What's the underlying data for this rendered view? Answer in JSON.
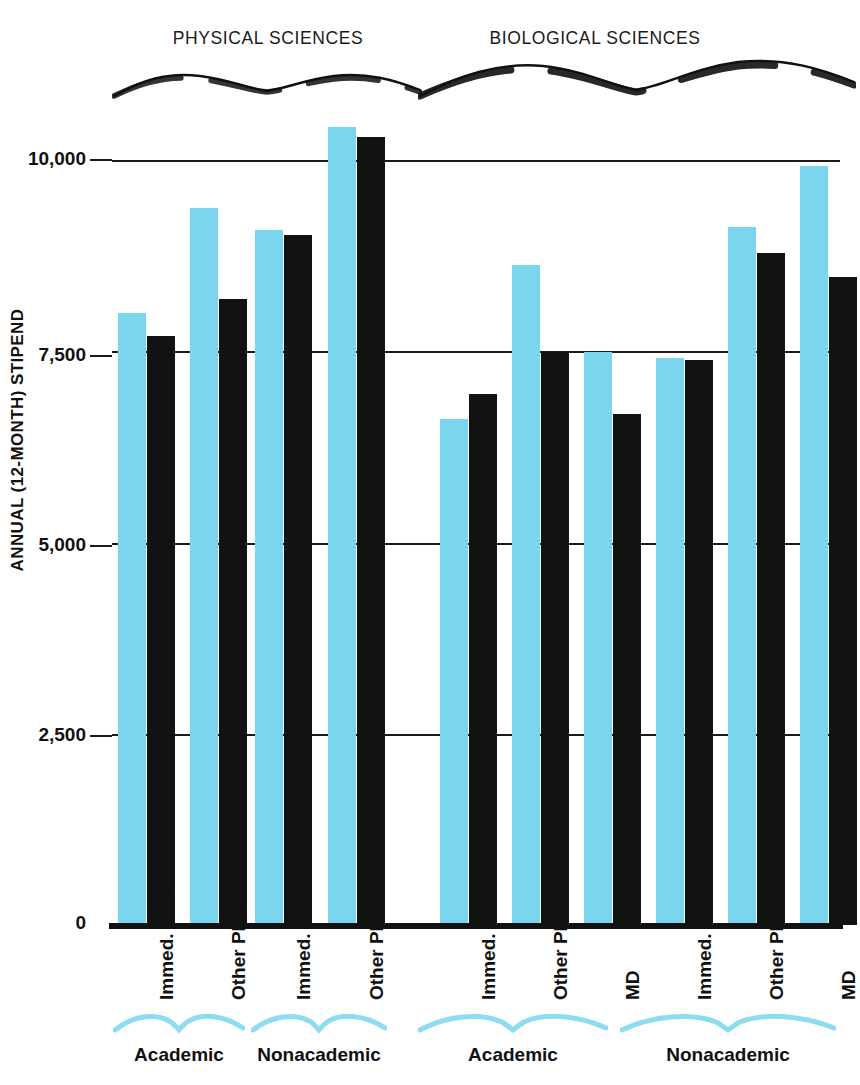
{
  "chart_data": {
    "type": "bar",
    "title": "",
    "xlabel": "",
    "ylabel": "ANNUAL (12-MONTH) STIPEND",
    "ylim": [
      0,
      10500
    ],
    "grid": true,
    "legend_position": "none",
    "ytick_labels": [
      "10,000",
      "7,500",
      "5,000",
      "2,500",
      "0"
    ],
    "ytick_values": [
      10000,
      7500,
      5000,
      2500,
      0
    ],
    "section_headers": [
      "PHYSICAL SCIENCES",
      "BIOLOGICAL SCIENCES"
    ],
    "sector_labels": [
      "Academic",
      "Nonacademic",
      "Academic",
      "Nonacademic"
    ],
    "categories": [
      "Immed. PhD",
      "Other PhD",
      "Immed. PhD",
      "Other PhD",
      "Immed. PhD",
      "Other PhD",
      "MD",
      "Immed. PhD",
      "Other PhD",
      "MD"
    ],
    "series": [
      {
        "name": "blue",
        "color": "#79d6ee",
        "values": [
          8000,
          9370,
          9080,
          10430,
          6620,
          8630,
          7490,
          7410,
          9130,
          9920
        ]
      },
      {
        "name": "black",
        "color": "#121212",
        "values": [
          7700,
          8180,
          9020,
          10300,
          6940,
          7490,
          6680,
          7390,
          8780,
          8470
        ]
      }
    ],
    "groups": [
      {
        "section": "PHYSICAL SCIENCES",
        "sector": "Academic",
        "bars": [
          {
            "category": "Immed. PhD",
            "blue": 8000,
            "black": 7700
          },
          {
            "category": "Other PhD",
            "blue": 9370,
            "black": 8180
          }
        ]
      },
      {
        "section": "PHYSICAL SCIENCES",
        "sector": "Nonacademic",
        "bars": [
          {
            "category": "Immed. PhD",
            "blue": 9080,
            "black": 9020
          },
          {
            "category": "Other PhD",
            "blue": 10430,
            "black": 10300
          }
        ]
      },
      {
        "section": "BIOLOGICAL SCIENCES",
        "sector": "Academic",
        "bars": [
          {
            "category": "Immed. PhD",
            "blue": 6620,
            "black": 6940
          },
          {
            "category": "Other PhD",
            "blue": 8630,
            "black": 7490
          },
          {
            "category": "MD",
            "blue": 7490,
            "black": 6680
          }
        ]
      },
      {
        "section": "BIOLOGICAL SCIENCES",
        "sector": "Nonacademic",
        "bars": [
          {
            "category": "Immed. PhD",
            "blue": 7410,
            "black": 7390
          },
          {
            "category": "Other PhD",
            "blue": 9130,
            "black": 8780
          },
          {
            "category": "MD",
            "blue": 9920,
            "black": 8470
          }
        ]
      }
    ]
  },
  "axis": {
    "y_title": "ANNUAL (12-MONTH) STIPEND",
    "ticks": [
      {
        "label": "10,000",
        "value": 10000
      },
      {
        "label": "7,500",
        "value": 7500
      },
      {
        "label": "5,000",
        "value": 5000
      },
      {
        "label": "2,500",
        "value": 2500
      },
      {
        "label": "0",
        "value": 0
      }
    ]
  },
  "headers": {
    "physical": "PHYSICAL SCIENCES",
    "biological": "BIOLOGICAL SCIENCES"
  },
  "bottom": {
    "sectors": [
      {
        "label": "Academic"
      },
      {
        "label": "Nonacademic"
      },
      {
        "label": "Academic"
      },
      {
        "label": "Nonacademic"
      }
    ],
    "categories": [
      {
        "label": "Immed. PhD"
      },
      {
        "label": "Other PhD"
      },
      {
        "label": "Immed. PhD"
      },
      {
        "label": "Other PhD"
      },
      {
        "label": "Immed. PhD"
      },
      {
        "label": "Other PhD"
      },
      {
        "label": "MD"
      },
      {
        "label": "Immed. PhD"
      },
      {
        "label": "Other PhD"
      },
      {
        "label": "MD"
      }
    ]
  },
  "colors": {
    "blue": "#79d6ee",
    "black": "#121212",
    "grid": "#1b1b1b",
    "background": "#ffffff"
  }
}
